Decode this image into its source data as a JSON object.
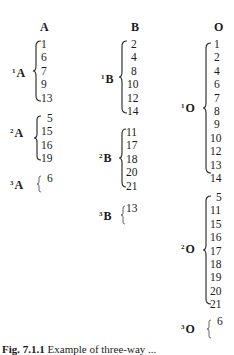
{
  "columns": [
    {
      "header": "A",
      "groups": [
        {
          "label": "A",
          "sup": "1",
          "values": [
            "1",
            "6",
            "7",
            "9",
            "13"
          ]
        },
        {
          "label": "A",
          "sup": "2",
          "values": [
            "5",
            "15",
            "16",
            "19"
          ]
        },
        {
          "label": "A",
          "sup": "3",
          "values": [
            "6"
          ]
        }
      ]
    },
    {
      "header": "B",
      "groups": [
        {
          "label": "B",
          "sup": "1",
          "values": [
            "2",
            "4",
            "8",
            "10",
            "12",
            "14"
          ]
        },
        {
          "label": "B",
          "sup": "2",
          "values": [
            "11",
            "17",
            "18",
            "20",
            "21"
          ]
        },
        {
          "label": "B",
          "sup": "3",
          "values": [
            "13"
          ]
        }
      ]
    },
    {
      "header": "O",
      "groups": [
        {
          "label": "O",
          "sup": "1",
          "values": [
            "1",
            "2",
            "4",
            "6",
            "7",
            "8",
            "9",
            "10",
            "12",
            "13",
            "14"
          ]
        },
        {
          "label": "O",
          "sup": "2",
          "values": [
            "5",
            "11",
            "15",
            "16",
            "17",
            "18",
            "19",
            "20",
            "21"
          ]
        },
        {
          "label": "O",
          "sup": "3",
          "values": [
            "6"
          ]
        }
      ]
    }
  ],
  "caption": {
    "fig": "Fig. 7.1.1",
    "text": "Example of three-way ..."
  }
}
